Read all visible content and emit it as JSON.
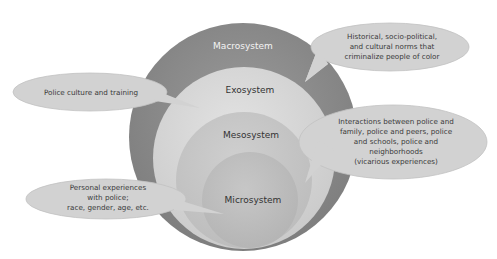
{
  "diagram": {
    "type": "nested-circles-ecological-model",
    "colors": {
      "macro": "#8a8a8a",
      "exo": "#d4d4d4",
      "meso": "#c4c4c4",
      "micro": "#b8b8b8",
      "bubble_fill": "#d2d2d2",
      "bubble_stroke": "#bdbdbd"
    },
    "systems": [
      {
        "id": "macro",
        "label": "Macrosystem"
      },
      {
        "id": "exo",
        "label": "Exosystem"
      },
      {
        "id": "meso",
        "label": "Mesosystem"
      },
      {
        "id": "micro",
        "label": "Microsystem"
      }
    ],
    "callouts": [
      {
        "target": "macro",
        "lines": [
          "Historical, socio-political,",
          "and cultural norms that",
          "criminalize people of color"
        ]
      },
      {
        "target": "exo",
        "lines": [
          "Police culture and training"
        ]
      },
      {
        "target": "meso",
        "lines": [
          "Interactions between police and",
          "family, police and peers, police",
          "and schools, police and",
          "neighborhoods",
          "(vicarious experiences)"
        ]
      },
      {
        "target": "micro",
        "lines": [
          "Personal experiences",
          "with police;",
          "race, gender, age, etc."
        ]
      }
    ]
  }
}
